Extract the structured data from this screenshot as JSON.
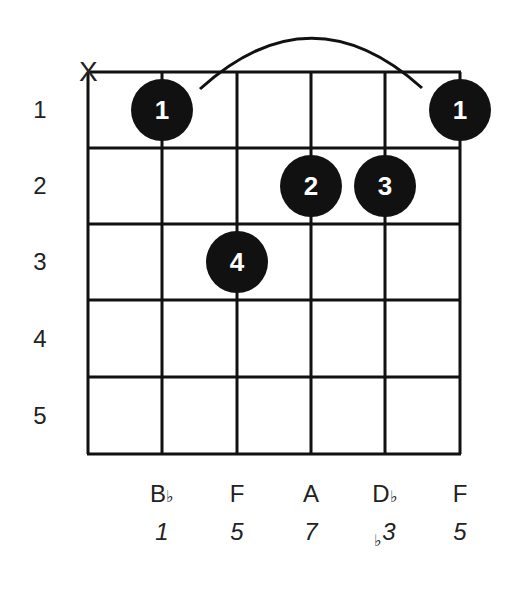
{
  "chord": {
    "grid": {
      "strings": 6,
      "frets": 5,
      "string_x": [
        88,
        162,
        237,
        311,
        385,
        460
      ],
      "fret_y": [
        72,
        148,
        224,
        300,
        377,
        454
      ],
      "line_color": "#111111"
    },
    "fret_labels": [
      "1",
      "2",
      "3",
      "4",
      "5"
    ],
    "muted_strings": [
      {
        "string": 1,
        "symbol": "X"
      }
    ],
    "barre": {
      "from_string": 2,
      "to_string": 6,
      "fret": 1
    },
    "fingers": [
      {
        "string": 2,
        "fret": 1,
        "finger": "1"
      },
      {
        "string": 6,
        "fret": 1,
        "finger": "1"
      },
      {
        "string": 4,
        "fret": 2,
        "finger": "2"
      },
      {
        "string": 5,
        "fret": 2,
        "finger": "3"
      },
      {
        "string": 3,
        "fret": 3,
        "finger": "4"
      }
    ],
    "notes": [
      {
        "string": 2,
        "note": "B",
        "accidental": "♭",
        "interval": "1",
        "interval_accidental": ""
      },
      {
        "string": 3,
        "note": "F",
        "accidental": "",
        "interval": "5",
        "interval_accidental": ""
      },
      {
        "string": 4,
        "note": "A",
        "accidental": "",
        "interval": "7",
        "interval_accidental": ""
      },
      {
        "string": 5,
        "note": "D",
        "accidental": "♭",
        "interval": "3",
        "interval_accidental": "♭"
      },
      {
        "string": 6,
        "note": "F",
        "accidental": "",
        "interval": "5",
        "interval_accidental": ""
      }
    ]
  }
}
